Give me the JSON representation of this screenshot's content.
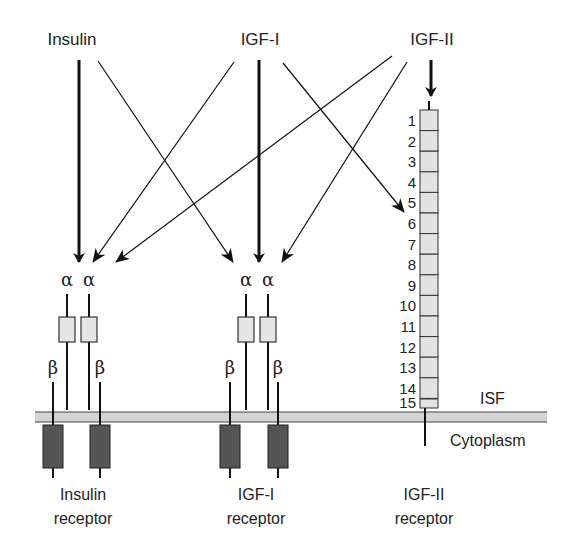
{
  "ligands": [
    {
      "id": "insulin",
      "label": "Insulin",
      "x": 72,
      "y": 45
    },
    {
      "id": "igf1",
      "label": "IGF-I",
      "x": 260,
      "y": 45
    },
    {
      "id": "igf2",
      "label": "IGF-II",
      "x": 432,
      "y": 45
    }
  ],
  "arrows": [
    {
      "from": "insulin",
      "to": "insulin-receptor",
      "x1": 79,
      "y1": 60,
      "x2": 79,
      "y2": 262,
      "weight": "thick"
    },
    {
      "from": "insulin",
      "to": "igf1-receptor",
      "x1": 98,
      "y1": 61,
      "x2": 233,
      "y2": 262,
      "weight": "thin"
    },
    {
      "from": "igf1",
      "to": "insulin-receptor",
      "x1": 234,
      "y1": 62,
      "x2": 93,
      "y2": 262,
      "weight": "thin"
    },
    {
      "from": "igf1",
      "to": "igf1-receptor",
      "x1": 259,
      "y1": 60,
      "x2": 259,
      "y2": 262,
      "weight": "thick"
    },
    {
      "from": "igf1",
      "to": "igf2-receptor",
      "x1": 283,
      "y1": 63,
      "x2": 404,
      "y2": 212,
      "weight": "thin"
    },
    {
      "from": "igf2",
      "to": "insulin-receptor",
      "x1": 392,
      "y1": 56,
      "x2": 116,
      "y2": 262,
      "weight": "thin"
    },
    {
      "from": "igf2",
      "to": "igf1-receptor",
      "x1": 407,
      "y1": 62,
      "x2": 282,
      "y2": 262,
      "weight": "thin"
    },
    {
      "from": "igf2",
      "to": "igf2-receptor",
      "x1": 431,
      "y1": 60,
      "x2": 431,
      "y2": 96,
      "weight": "thick"
    }
  ],
  "receptors": [
    {
      "id": "insulin-receptor",
      "name_line1": "Insulin",
      "name_line2": "receptor",
      "label_x": 83,
      "alpha_x": [
        67,
        89
      ],
      "beta_x": [
        53,
        100
      ],
      "alpha_label": "α",
      "beta_label": "β"
    },
    {
      "id": "igf1-receptor",
      "name_line1": "IGF-I",
      "name_line2": "receptor",
      "label_x": 256,
      "alpha_x": [
        246,
        268
      ],
      "beta_x": [
        230,
        278
      ],
      "alpha_label": "α",
      "beta_label": "β"
    }
  ],
  "igf2_receptor": {
    "name_line1": "IGF-II",
    "name_line2": "receptor",
    "label_x": 424,
    "segments": [
      "1",
      "2",
      "3",
      "4",
      "5",
      "6",
      "7",
      "8",
      "9",
      "10",
      "11",
      "12",
      "13",
      "14",
      "15"
    ]
  },
  "membrane": {
    "top_label": "ISF",
    "bottom_label": "Cytoplasm"
  },
  "colors": {
    "stroke": "#222222",
    "membrane_fill": "#d4d4d4",
    "alpha_box": "#e4e4e4",
    "beta_box": "#555555",
    "segment_fill": "#e2e2e2"
  }
}
